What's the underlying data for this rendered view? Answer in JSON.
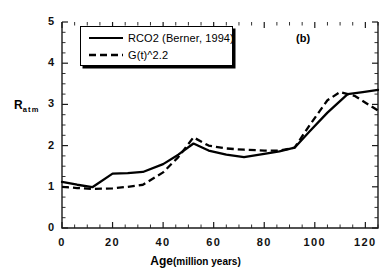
{
  "figure": {
    "panel_label": "(b)",
    "background": "#ffffff",
    "line_color": "#000000"
  },
  "chart_data": {
    "type": "line",
    "title": "",
    "subtitle": "",
    "xlabel": "Age",
    "xlabel_units": "(million years)",
    "ylabel": "R",
    "ylabel_subscript": "atm",
    "xlim": [
      0,
      125
    ],
    "ylim": [
      0,
      5
    ],
    "xticks": [
      0,
      20,
      40,
      60,
      80,
      100,
      120
    ],
    "xtick_labels": [
      "0",
      "20",
      "40",
      "60",
      "80",
      "100",
      "120"
    ],
    "xtick_minor_step": 5,
    "yticks": [
      0,
      1,
      2,
      3,
      4,
      5
    ],
    "ytick_labels": [
      "0",
      "1",
      "2",
      "3",
      "4",
      "5"
    ],
    "ytick_minor_step": 0.25,
    "grid": false,
    "legend_position": "upper-left",
    "annotations": [
      {
        "name": "panel-label",
        "text": "(b)",
        "x": 106,
        "y": 4.55
      }
    ],
    "series": [
      {
        "name": "RCO2 (Berner, 1994)",
        "style": "solid",
        "color": "#000000",
        "x": [
          0,
          6,
          12,
          20,
          26,
          32,
          40,
          46,
          52,
          58,
          65,
          72,
          80,
          86,
          92,
          98,
          105,
          113,
          119,
          125
        ],
        "y": [
          1.12,
          1.05,
          0.99,
          1.32,
          1.33,
          1.36,
          1.55,
          1.78,
          2.05,
          1.88,
          1.78,
          1.72,
          1.8,
          1.86,
          1.95,
          2.35,
          2.8,
          3.25,
          3.3,
          3.35
        ]
      },
      {
        "name": "G(t)^2.2",
        "style": "dashed",
        "color": "#000000",
        "x": [
          0,
          6,
          12,
          20,
          26,
          32,
          40,
          46,
          52,
          58,
          65,
          72,
          80,
          86,
          92,
          98,
          105,
          110,
          116,
          125
        ],
        "y": [
          1.0,
          0.97,
          0.95,
          0.96,
          1.0,
          1.05,
          1.35,
          1.72,
          2.2,
          2.0,
          1.93,
          1.9,
          1.88,
          1.88,
          1.95,
          2.5,
          3.1,
          3.3,
          3.2,
          2.85
        ]
      }
    ]
  },
  "legend": {
    "items": [
      {
        "label": "RCO2 (Berner, 1994)",
        "style": "solid"
      },
      {
        "label": "G(t)^2.2",
        "style": "dashed"
      }
    ]
  }
}
